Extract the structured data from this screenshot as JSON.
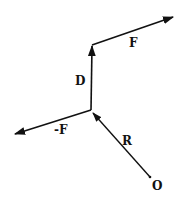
{
  "diagram": {
    "stroke_color": "#111111",
    "background": "#ffffff",
    "points": {
      "origin": {
        "label": "O",
        "x": 150,
        "y": 177
      },
      "junction": {
        "x": 91,
        "y": 110
      },
      "top": {
        "x": 92,
        "y": 45
      }
    },
    "vectors": [
      {
        "name": "R",
        "label": "R",
        "from": [
          150,
          177
        ],
        "to": [
          91,
          110
        ]
      },
      {
        "name": "D",
        "label": "D",
        "from": [
          91,
          110
        ],
        "to": [
          92,
          45
        ]
      },
      {
        "name": "F",
        "label": "F",
        "from": [
          92,
          45
        ],
        "to": [
          173,
          17
        ]
      },
      {
        "name": "neg-F",
        "label": "-F",
        "from": [
          91,
          110
        ],
        "to": [
          14,
          134
        ]
      }
    ],
    "labels": {
      "F": "F",
      "D": "D",
      "negF": "-F",
      "R": "R",
      "O": "O"
    }
  }
}
